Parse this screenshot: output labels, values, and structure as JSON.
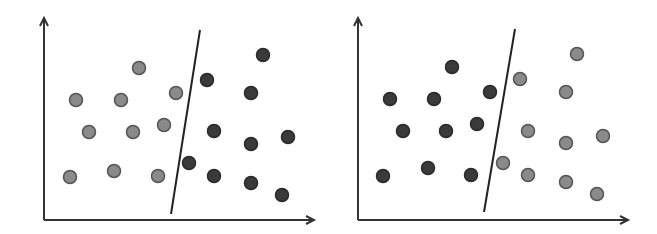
{
  "colors": {
    "background": "#ffffff",
    "axis": "#333333",
    "light_point": "#8a8a8a",
    "dark_point": "#3a3a3a",
    "point_stroke": "#555555",
    "boundary": "#222222"
  },
  "panels": [
    {
      "name": "left",
      "axis": {
        "origin": [
          44,
          220
        ],
        "y_top": 18,
        "x_right": 314
      },
      "boundary": [
        [
          200,
          30
        ],
        [
          171,
          214
        ]
      ],
      "light_points": [
        [
          76,
          100
        ],
        [
          121,
          100
        ],
        [
          139,
          68
        ],
        [
          176,
          93
        ],
        [
          89,
          132
        ],
        [
          133,
          132
        ],
        [
          164,
          125
        ],
        [
          70,
          177
        ],
        [
          114,
          171
        ],
        [
          158,
          176
        ]
      ],
      "dark_points": [
        [
          207,
          80
        ],
        [
          263,
          55
        ],
        [
          251,
          93
        ],
        [
          214,
          131
        ],
        [
          251,
          144
        ],
        [
          288,
          137
        ],
        [
          189,
          163
        ],
        [
          214,
          176
        ],
        [
          251,
          183
        ],
        [
          282,
          195
        ]
      ]
    },
    {
      "name": "right",
      "axis": {
        "origin": [
          358,
          220
        ],
        "y_top": 18,
        "x_right": 628
      },
      "boundary": [
        [
          515,
          29
        ],
        [
          484,
          212
        ]
      ],
      "light_points": [
        [
          520,
          79
        ],
        [
          566,
          92
        ],
        [
          577,
          54
        ],
        [
          528,
          131
        ],
        [
          566,
          143
        ],
        [
          603,
          136
        ],
        [
          503,
          163
        ],
        [
          528,
          175
        ],
        [
          566,
          182
        ],
        [
          597,
          194
        ]
      ],
      "dark_points": [
        [
          390,
          99
        ],
        [
          434,
          99
        ],
        [
          452,
          67
        ],
        [
          490,
          92
        ],
        [
          403,
          131
        ],
        [
          446,
          131
        ],
        [
          477,
          124
        ],
        [
          383,
          176
        ],
        [
          428,
          168
        ],
        [
          471,
          175
        ]
      ]
    }
  ]
}
